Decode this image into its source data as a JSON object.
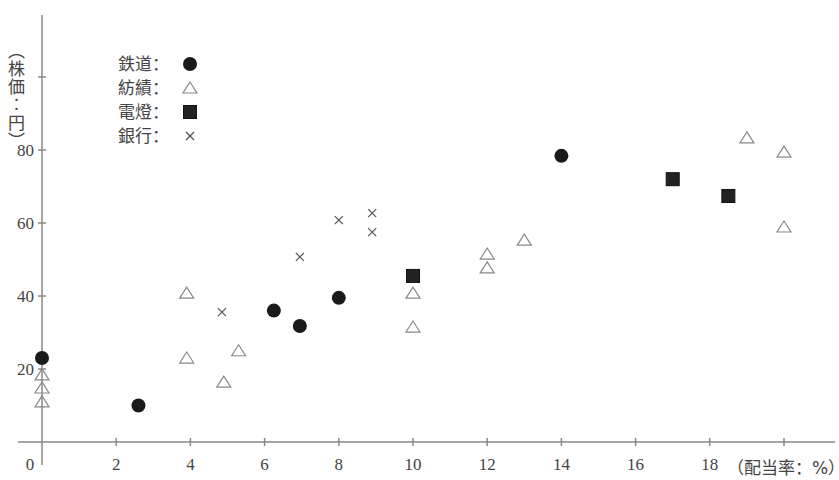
{
  "chart_data": {
    "type": "scatter",
    "title": "",
    "xlabel": "（配当率：%）",
    "ylabel": "（株価：円）",
    "xlim": [
      0,
      21
    ],
    "ylim": [
      0,
      100
    ],
    "x_ticks": [
      0,
      2,
      4,
      6,
      8,
      10,
      12,
      14,
      16,
      18
    ],
    "y_ticks": [
      20,
      40,
      60,
      80,
      100
    ],
    "y_tick_labels": [
      "20",
      "40",
      "60",
      "80",
      ""
    ],
    "x_tick_labels": [
      "0",
      "2",
      "4",
      "6",
      "8",
      "10",
      "12",
      "14",
      "16",
      "18"
    ],
    "grid": false,
    "legend_position": "upper-left",
    "series": [
      {
        "name": "鉄道",
        "marker": "filled-circle",
        "color": "#222222",
        "points": [
          [
            0,
            23
          ],
          [
            2.6,
            10
          ],
          [
            6.25,
            36
          ],
          [
            6.95,
            31.8
          ],
          [
            8,
            39.5
          ],
          [
            14,
            78.4
          ]
        ]
      },
      {
        "name": "紡績",
        "marker": "open-triangle",
        "color": "#888888",
        "points": [
          [
            0,
            18.4
          ],
          [
            0,
            14.8
          ],
          [
            0,
            11
          ],
          [
            3.9,
            40.8
          ],
          [
            3.9,
            23
          ],
          [
            4.9,
            16.4
          ],
          [
            5.3,
            25
          ],
          [
            10,
            40.8
          ],
          [
            10,
            31.5
          ],
          [
            12,
            51.5
          ],
          [
            12,
            47.7
          ],
          [
            13,
            55.3
          ],
          [
            19,
            83.3
          ],
          [
            20,
            79.4
          ],
          [
            20,
            58.9
          ]
        ]
      },
      {
        "name": "電燈",
        "marker": "filled-square",
        "color": "#222222",
        "points": [
          [
            10,
            45.5
          ],
          [
            17,
            72
          ],
          [
            18.5,
            67.4
          ]
        ]
      },
      {
        "name": "銀行",
        "marker": "x",
        "color": "#555555",
        "points": [
          [
            4.85,
            35.6
          ],
          [
            6.95,
            50.7
          ],
          [
            8,
            60.8
          ],
          [
            8.9,
            62.7
          ],
          [
            8.9,
            57.5
          ]
        ]
      }
    ]
  },
  "legend": {
    "separator": "：",
    "items": [
      "鉄道",
      "紡績",
      "電燈",
      "銀行"
    ]
  }
}
